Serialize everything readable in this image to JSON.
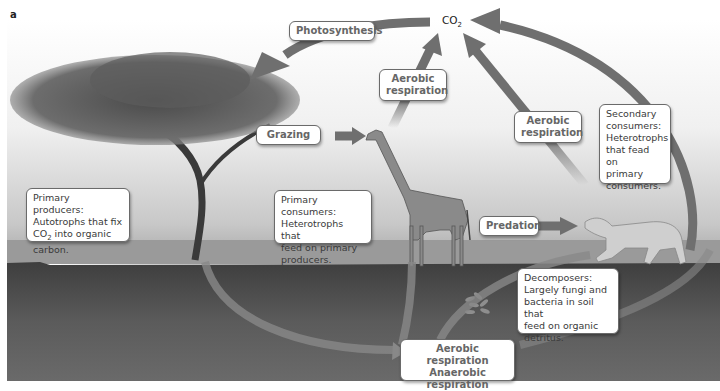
{
  "figure": {
    "panel_label": "a"
  },
  "co2_label": "CO",
  "co2_subscript": "2",
  "processes": {
    "photosynthesis": "Photosynthesis",
    "aerobic_respiration_consumer_line1": "Aerobic",
    "aerobic_respiration_consumer_line2": "respiration",
    "aerobic_respiration_predator_line1": "Aerobic",
    "aerobic_respiration_predator_line2": "respiration",
    "grazing": "Grazing",
    "predation": "Predation",
    "decomposition_line1": "Aerobic respiration",
    "decomposition_line2": "Anaerobic respiration",
    "decomposition_line3": "Fermentation"
  },
  "organisms": {
    "primary_producers": {
      "line1": "Primary producers:",
      "line2": "Autotrophs that fix",
      "line3_pre": "CO",
      "line3_sub": "2",
      "line3_post": " into organic",
      "line4": "carbon."
    },
    "primary_consumers": {
      "line1": "Primary consumers:",
      "line2": "Heterotrophs that",
      "line3": "feed on primary",
      "line4": "producers."
    },
    "secondary_consumers": {
      "line1": "Secondary",
      "line2": "consumers:",
      "line3": "Heterotrophs",
      "line4": "that fead on",
      "line5": "primary",
      "line6": "consumers."
    },
    "decomposers": {
      "line1": "Decomposers:",
      "line2": "Largely fungi and",
      "line3": "bacteria in soil that",
      "line4": "feed on organic",
      "line5": "detritus."
    }
  },
  "colors": {
    "arrow": "#6f6f6f",
    "sky": "#f2f2f2",
    "horizon": "#bdbdbd",
    "soil": "#5a5a5a",
    "box_border": "#6a6a6a"
  }
}
